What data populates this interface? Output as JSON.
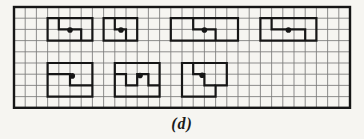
{
  "caption": "(d)",
  "colors": {
    "paper": "#f6f5f1",
    "grid_line": "#5d5d5d",
    "ink": "#161616"
  },
  "grid": {
    "x": 14,
    "y": 7,
    "cols": 30,
    "rows": 9,
    "cell": 11.2,
    "border_width": 2.4,
    "grid_line_width": 0.85,
    "shape_line_width": 2.2,
    "dot_radius": 2.8
  },
  "shapes": [
    {
      "name": "top-1",
      "outline": [
        [
          3,
          1
        ],
        [
          7,
          1
        ],
        [
          7,
          3
        ],
        [
          3,
          3
        ]
      ],
      "cut": [
        [
          4,
          1
        ],
        [
          4,
          2
        ],
        [
          6,
          2
        ],
        [
          6,
          3
        ]
      ],
      "dot": [
        5.0,
        2.05
      ]
    },
    {
      "name": "top-2",
      "outline": [
        [
          8,
          1
        ],
        [
          11,
          1
        ],
        [
          11,
          3
        ],
        [
          8,
          3
        ]
      ],
      "cut": [
        [
          9,
          1
        ],
        [
          9,
          2
        ],
        [
          10,
          2
        ],
        [
          10,
          3
        ]
      ],
      "dot": [
        9.55,
        2.05
      ]
    },
    {
      "name": "top-3",
      "outline": [
        [
          14,
          1
        ],
        [
          20,
          1
        ],
        [
          20,
          3
        ],
        [
          14,
          3
        ]
      ],
      "cut": [
        [
          16,
          1
        ],
        [
          16,
          2
        ],
        [
          18,
          2
        ],
        [
          18,
          3
        ]
      ],
      "dot": [
        17.0,
        2.05
      ]
    },
    {
      "name": "top-4",
      "outline": [
        [
          22,
          1
        ],
        [
          27,
          1
        ],
        [
          27,
          3
        ],
        [
          22,
          3
        ]
      ],
      "cut": [
        [
          23,
          1
        ],
        [
          23,
          2
        ],
        [
          26,
          2
        ],
        [
          26,
          3
        ]
      ],
      "dot": [
        24.5,
        2.05
      ]
    },
    {
      "name": "bottom-1",
      "outline": [
        [
          3,
          5
        ],
        [
          7,
          5
        ],
        [
          7,
          8
        ],
        [
          3,
          8
        ]
      ],
      "cut": [
        [
          3,
          6
        ],
        [
          5,
          6
        ],
        [
          5,
          7
        ],
        [
          7,
          7
        ]
      ],
      "dot": [
        5.2,
        6.15
      ]
    },
    {
      "name": "bottom-2",
      "outline": [
        [
          9,
          5
        ],
        [
          13,
          5
        ],
        [
          13,
          8
        ],
        [
          9,
          8
        ]
      ],
      "cut": [
        [
          9,
          6
        ],
        [
          10,
          6
        ],
        [
          10,
          7
        ],
        [
          11,
          7
        ],
        [
          11,
          6
        ],
        [
          12,
          6
        ],
        [
          12,
          7
        ],
        [
          13,
          7
        ]
      ],
      "dot": [
        11.25,
        6.12
      ]
    },
    {
      "name": "bottom-3",
      "outline": [
        [
          15,
          5
        ],
        [
          19,
          5
        ],
        [
          19,
          7
        ],
        [
          18,
          7
        ],
        [
          18,
          8
        ],
        [
          15,
          8
        ]
      ],
      "cut": [
        [
          16,
          5
        ],
        [
          16,
          6
        ],
        [
          17,
          6
        ],
        [
          17,
          7
        ],
        [
          18,
          7
        ]
      ],
      "dot": [
        16.8,
        6.1
      ]
    }
  ]
}
